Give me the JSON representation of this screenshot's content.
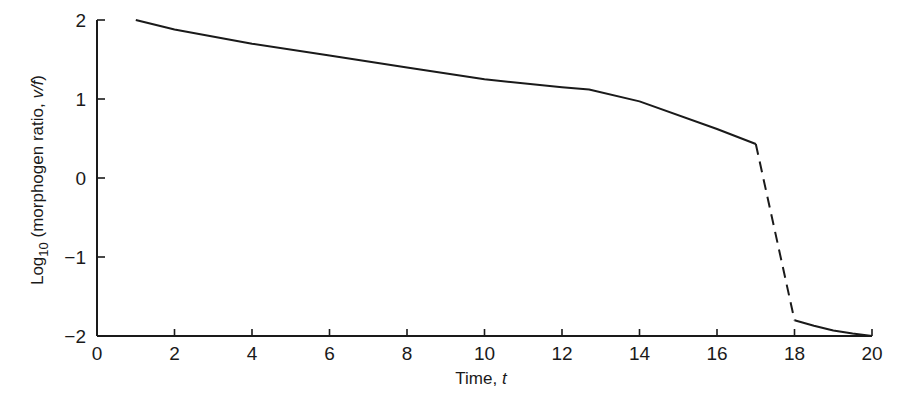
{
  "chart_data": {
    "type": "line",
    "title": "",
    "xlabel": "Time, t",
    "ylabel": "Log10 (morphogen ratio, v/f)",
    "ylabel_parts": {
      "prefix": "Log",
      "subscript": "10",
      "rest": " (morphogen ratio, ",
      "italic": "v/f",
      "suffix": ")"
    },
    "xlabel_parts": {
      "text": "Time, ",
      "italic": "t"
    },
    "xlim": [
      0,
      20
    ],
    "ylim": [
      -2,
      2
    ],
    "x_ticks": [
      0,
      2,
      4,
      6,
      8,
      10,
      12,
      14,
      16,
      18,
      20
    ],
    "y_ticks": [
      2,
      1,
      0,
      -1,
      -2
    ],
    "y_tick_labels": [
      "2",
      "1",
      "0",
      "−1",
      "−2"
    ],
    "grid": false,
    "legend": null,
    "series": [
      {
        "name": "solid-upper",
        "style": "solid",
        "x": [
          1.0,
          2,
          4,
          6,
          8,
          10,
          12,
          12.7,
          14,
          16,
          17
        ],
        "y": [
          2.0,
          1.88,
          1.7,
          1.55,
          1.4,
          1.25,
          1.15,
          1.12,
          0.97,
          0.62,
          0.43
        ]
      },
      {
        "name": "dashed-transition",
        "style": "dashed",
        "x": [
          17,
          18
        ],
        "y": [
          0.43,
          -1.8
        ]
      },
      {
        "name": "solid-lower",
        "style": "solid",
        "x": [
          18,
          18.5,
          19,
          19.5,
          20
        ],
        "y": [
          -1.8,
          -1.87,
          -1.93,
          -1.97,
          -2.0
        ]
      }
    ],
    "line_color": "#1a1a1a"
  }
}
